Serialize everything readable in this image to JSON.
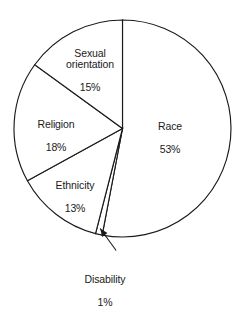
{
  "chart_data": {
    "type": "pie",
    "title": "",
    "subtitle": "",
    "xlabel": "",
    "ylabel": "",
    "legend_position": "none",
    "grid": false,
    "value_unit": "%",
    "start_angle_deg": 0,
    "direction": "clockwise",
    "categories": [
      "Race",
      "Disability",
      "Ethnicity",
      "Religion",
      "Sexual orientation"
    ],
    "values": [
      53,
      1,
      13,
      18,
      15
    ],
    "slices": [
      {
        "label": "Race",
        "value": 53,
        "value_text": "53%",
        "label_text": "Race",
        "start_deg": 0,
        "end_deg": 190.8,
        "fill": "#ffffff",
        "stroke": "#1a1a1a",
        "callout": false
      },
      {
        "label": "Disability",
        "value": 1,
        "value_text": "1%",
        "label_text": "Disability",
        "start_deg": 190.8,
        "end_deg": 194.4,
        "fill": "#ffffff",
        "stroke": "#1a1a1a",
        "callout": true
      },
      {
        "label": "Ethnicity",
        "value": 13,
        "value_text": "13%",
        "label_text": "Ethnicity",
        "start_deg": 194.4,
        "end_deg": 241.2,
        "fill": "#ffffff",
        "stroke": "#1a1a1a",
        "callout": false
      },
      {
        "label": "Religion",
        "value": 18,
        "value_text": "18%",
        "label_text": "Religion",
        "start_deg": 241.2,
        "end_deg": 306.0,
        "fill": "#ffffff",
        "stroke": "#1a1a1a",
        "callout": false
      },
      {
        "label": "Sexual orientation",
        "value": 15,
        "value_text": "15%",
        "label_text": "Sexual\norientation",
        "start_deg": 306.0,
        "end_deg": 360.0,
        "fill": "#ffffff",
        "stroke": "#1a1a1a",
        "callout": false
      }
    ]
  },
  "geometry": {
    "center_x": 122.5,
    "center_y": 128.5,
    "radius": 108.5
  },
  "colors": {
    "ink": "#1a1a1a",
    "background": "#ffffff"
  }
}
